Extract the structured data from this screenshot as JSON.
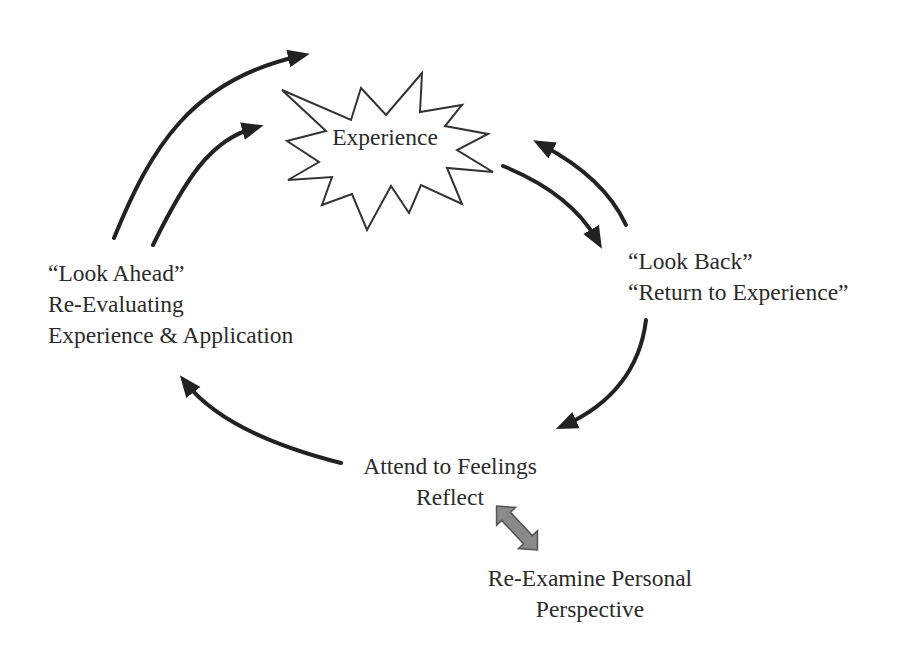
{
  "diagram": {
    "type": "cycle",
    "colors": {
      "background": "#ffffff",
      "text": "#2b2b2b",
      "arrow": "#222222",
      "double_arrow_fill": "#8a8a8a",
      "double_arrow_stroke": "#555555",
      "starburst_stroke": "#333333"
    },
    "center_node": {
      "label": "Experience",
      "shape": "starburst"
    },
    "nodes": {
      "look_back": {
        "lines": [
          "“Look Back”",
          "“Return to Experience”"
        ]
      },
      "attend": {
        "lines": [
          "Attend to Feelings",
          "Reflect"
        ]
      },
      "re_examine": {
        "lines": [
          "Re-Examine Personal",
          "Perspective"
        ]
      },
      "look_ahead": {
        "lines": [
          "“Look Ahead”",
          "Re-Evaluating",
          "Experience & Application"
        ]
      }
    },
    "edges": [
      {
        "from": "Experience",
        "to": "Look Back",
        "style": "curved-arrow"
      },
      {
        "from": "Look Back",
        "to": "Experience",
        "style": "curved-arrow"
      },
      {
        "from": "Look Back",
        "to": "Attend to Feelings",
        "style": "curved-arrow"
      },
      {
        "from": "Attend to Feelings",
        "to": "Look Ahead",
        "style": "curved-arrow"
      },
      {
        "from": "Look Ahead",
        "to": "Experience",
        "style": "curved-arrow"
      },
      {
        "from": "Look Ahead",
        "to": "beyond Experience",
        "style": "curved-arrow"
      },
      {
        "from": "Reflect",
        "to": "Re-Examine Personal Perspective",
        "style": "double-arrow-gray"
      }
    ]
  }
}
